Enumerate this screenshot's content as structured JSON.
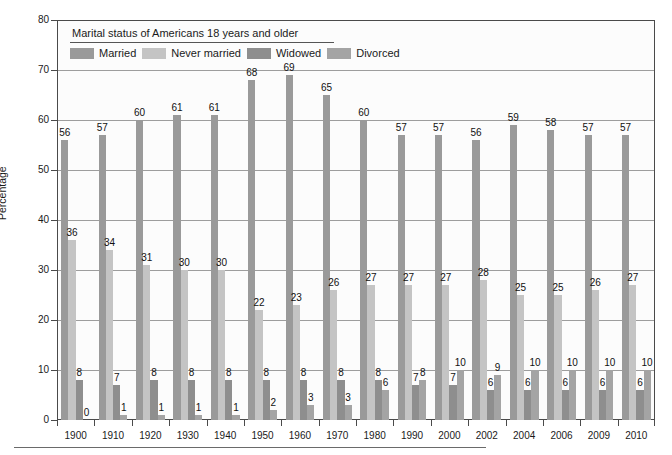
{
  "chart_data": {
    "type": "bar",
    "title": "Marital status of Americans 18 years and older",
    "xlabel": "",
    "ylabel": "Percentage",
    "ylim": [
      0,
      80
    ],
    "ytick_step": 10,
    "grid": true,
    "legend_position": "top-left",
    "categories": [
      "1900",
      "1910",
      "1920",
      "1930",
      "1940",
      "1950",
      "1960",
      "1970",
      "1980",
      "1990",
      "2000",
      "2002",
      "2004",
      "2006",
      "2009",
      "2010"
    ],
    "series": [
      {
        "name": "Married",
        "color": "#9a9a9a",
        "values": [
          56,
          57,
          60,
          61,
          61,
          68,
          69,
          65,
          60,
          57,
          57,
          56,
          59,
          58,
          57,
          57
        ]
      },
      {
        "name": "Never married",
        "color": "#c4c4c4",
        "values": [
          36,
          34,
          31,
          30,
          30,
          22,
          23,
          26,
          27,
          27,
          27,
          28,
          25,
          25,
          26,
          27
        ]
      },
      {
        "name": "Widowed",
        "color": "#8e8e8e",
        "values": [
          8,
          7,
          8,
          8,
          8,
          8,
          8,
          8,
          8,
          7,
          7,
          6,
          6,
          6,
          6,
          6
        ]
      },
      {
        "name": "Divorced",
        "color": "#a4a4a4",
        "values": [
          0,
          1,
          1,
          1,
          1,
          2,
          3,
          3,
          6,
          8,
          10,
          9,
          10,
          10,
          10,
          10
        ]
      }
    ],
    "ytick_labels": [
      "0",
      "10",
      "20",
      "30",
      "40",
      "50",
      "60",
      "70",
      "80"
    ]
  },
  "legend": {
    "title": "Marital status of Americans 18 years and older",
    "items": [
      {
        "label": "Married"
      },
      {
        "label": "Never married"
      },
      {
        "label": "Widowed"
      },
      {
        "label": "Divorced"
      }
    ]
  },
  "axis": {
    "y_title": "Percentage"
  }
}
